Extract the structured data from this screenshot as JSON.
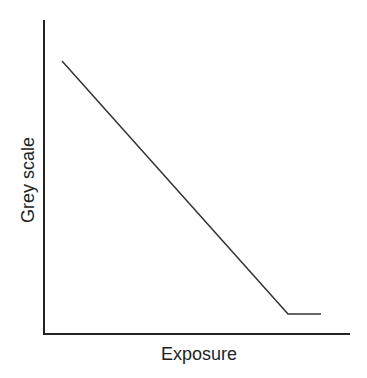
{
  "chart_data": {
    "type": "line",
    "title": "",
    "xlabel": "Exposure",
    "ylabel": "Grey scale",
    "grid": false,
    "legend": null,
    "ticks": {
      "x": [],
      "y": []
    },
    "series": [
      {
        "name": "Grey scale vs Exposure",
        "points_px": [
          [
            62,
            61
          ],
          [
            288,
            314
          ],
          [
            321,
            314
          ]
        ],
        "description": "Linear decrease from high grey scale at low exposure to a plateau (saturation) at high exposure"
      }
    ],
    "colors": {
      "axis": "#222222",
      "line": "#333333"
    }
  },
  "labels": {
    "x_axis": "Exposure",
    "y_axis": "Grey scale"
  }
}
